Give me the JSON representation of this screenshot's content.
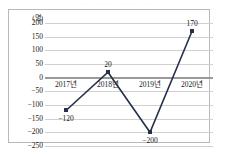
{
  "page": {
    "top_cut_text": "· ·· · ·· · · · ·· · · · ··"
  },
  "chart_data": {
    "type": "line",
    "title": "",
    "subtitle": "",
    "xlabel": "",
    "ylabel": "",
    "yunit": "(명)",
    "categories": [
      "2017년",
      "2018년",
      "2019년",
      "2020년"
    ],
    "values": [
      -120,
      20,
      -200,
      170
    ],
    "point_labels": [
      "−120",
      "20",
      "−200",
      "170"
    ],
    "series": [
      {
        "name": "",
        "values": [
          -120,
          20,
          -200,
          170
        ],
        "color": "#26304a",
        "marker": "square"
      }
    ],
    "ylim": [
      -250,
      200
    ],
    "yticks": [
      200,
      150,
      100,
      50,
      0,
      -50,
      -100,
      -150,
      -200,
      -250
    ],
    "ytick_labels": [
      "200",
      "150",
      "100",
      "50",
      "0",
      "−50",
      "−100",
      "−150",
      "−200",
      "−250"
    ],
    "grid": true,
    "zero_line": true,
    "legend": "none",
    "colors": {
      "line": "#26304a",
      "grid": "#d0d0d0",
      "zero": "#9a9a9a",
      "frame": "#b9b9b9",
      "text": "#1a1a1a"
    }
  }
}
